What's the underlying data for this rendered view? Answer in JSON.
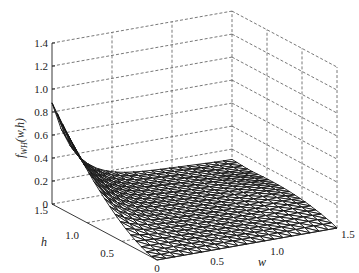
{
  "chart_data": {
    "type": "surface",
    "title": "",
    "xlabel": "w",
    "ylabel": "h",
    "zlabel": "f_WH(w,h)",
    "zlabel_parts": {
      "f": "f",
      "sub": "WH",
      "args": "(w,h)"
    },
    "xlim": [
      0,
      1.5
    ],
    "ylim": [
      0,
      1.5
    ],
    "zlim": [
      0,
      1.4
    ],
    "x_ticks": [
      "0",
      "0.5",
      "1.0",
      "1.5"
    ],
    "y_ticks": [
      "0",
      "0.5",
      "1.0",
      "1.5"
    ],
    "z_ticks": [
      "0",
      "0.2",
      "0.4",
      "0.6",
      "0.8",
      "1.0",
      "1.2",
      "1.4"
    ],
    "grid": true,
    "grid_style": "dashed",
    "mesh": "triangular wireframe",
    "grid_points": 21,
    "key_values": [
      {
        "w": 0,
        "h": 1.5,
        "z": 1.0
      },
      {
        "w": 0,
        "h": 0,
        "z": 0
      },
      {
        "w": 1.5,
        "h": 0,
        "z": 0
      },
      {
        "w": 0.5,
        "h": 1.5,
        "z": 0.15
      },
      {
        "w": 1.5,
        "h": 1.5,
        "z": 0.12
      }
    ]
  }
}
